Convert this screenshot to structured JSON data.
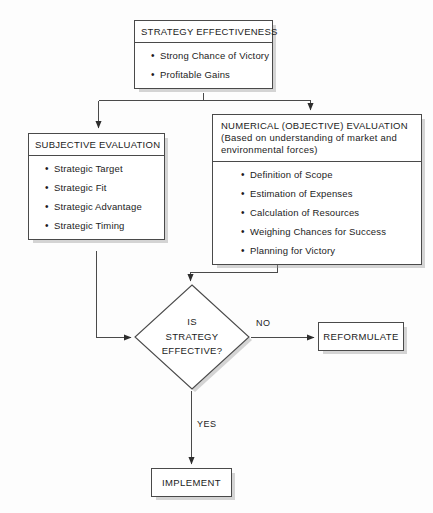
{
  "diagram": {
    "colors": {
      "stroke": "#4a4a4a",
      "text": "#1c1c1c",
      "background": "#fdfdfd",
      "shadow": "#969696"
    }
  },
  "nodes": {
    "strategy_effectiveness": {
      "header": "STRATEGY EFFECTIVENESS",
      "bullets": [
        "Strong Chance of Victory",
        "Profitable Gains"
      ]
    },
    "subjective_evaluation": {
      "header": "SUBJECTIVE EVALUATION",
      "bullets": [
        "Strategic Target",
        "Strategic Fit",
        "Strategic Advantage",
        "Strategic Timing"
      ]
    },
    "numerical_evaluation": {
      "header_line1": "NUMERICAL (OBJECTIVE) EVALUATION",
      "header_line2": "(Based on understanding of market and",
      "header_line3": "environmental forces)",
      "bullets": [
        "Definition of Scope",
        "Estimation of Expenses",
        "Calculation of Resources",
        "Weighing Chances for Success",
        "Planning for Victory"
      ]
    },
    "decision": {
      "line1": "IS",
      "line2": "STRATEGY",
      "line3": "EFFECTIVE?"
    },
    "reformulate": {
      "label": "REFORMULATE"
    },
    "implement": {
      "label": "IMPLEMENT"
    }
  },
  "edges": {
    "no_label": "NO",
    "yes_label": "YES"
  },
  "bullet_glyph": "•"
}
